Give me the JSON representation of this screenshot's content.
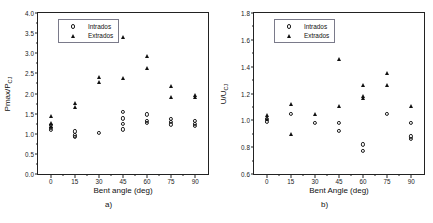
{
  "figure": {
    "panels": [
      {
        "id": "a",
        "caption": "a)",
        "legend": [
          {
            "label": "Intrados",
            "marker": "open-circle"
          },
          {
            "label": "Extrados",
            "marker": "filled-triangle"
          }
        ]
      },
      {
        "id": "b",
        "caption": "b)",
        "legend": [
          {
            "label": "Intrados",
            "marker": "open-circle"
          },
          {
            "label": "Extrados",
            "marker": "filled-triangle"
          }
        ]
      }
    ]
  },
  "chart_data": [
    {
      "type": "scatter",
      "panel": "a",
      "title": "",
      "xlabel": "Bent angle (deg)",
      "ylabel": "Pmax/PCJ",
      "ylabel_main": "Pmax/P",
      "ylabel_sub": "CJ",
      "xlim": [
        -8,
        98
      ],
      "ylim": [
        0.0,
        4.0
      ],
      "xticks": [
        0,
        15,
        30,
        45,
        60,
        75,
        90
      ],
      "xticklabels": [
        "0",
        "15",
        "30",
        "45",
        "60",
        "75",
        "90"
      ],
      "yticks": [
        0.0,
        0.5,
        1.0,
        1.5,
        2.0,
        2.5,
        3.0,
        3.5,
        4.0
      ],
      "yticklabels": [
        "0.0",
        "0.5",
        "1.0",
        "1.5",
        "2.0",
        "2.5",
        "3.0",
        "3.5",
        "4.0"
      ],
      "grid": false,
      "legend_position": "top-left",
      "series": [
        {
          "name": "Intrados",
          "marker": "open-circle",
          "points": [
            {
              "x": 0,
              "y": 1.22
            },
            {
              "x": 0,
              "y": 1.15
            },
            {
              "x": 0,
              "y": 1.09
            },
            {
              "x": 15,
              "y": 1.06
            },
            {
              "x": 15,
              "y": 0.96
            },
            {
              "x": 15,
              "y": 0.92
            },
            {
              "x": 30,
              "y": 1.02
            },
            {
              "x": 45,
              "y": 1.55
            },
            {
              "x": 45,
              "y": 1.38
            },
            {
              "x": 45,
              "y": 1.24
            },
            {
              "x": 45,
              "y": 1.11
            },
            {
              "x": 60,
              "y": 1.48
            },
            {
              "x": 60,
              "y": 1.32
            },
            {
              "x": 60,
              "y": 1.27
            },
            {
              "x": 75,
              "y": 1.37
            },
            {
              "x": 75,
              "y": 1.3
            },
            {
              "x": 75,
              "y": 1.23
            },
            {
              "x": 90,
              "y": 1.31
            },
            {
              "x": 90,
              "y": 1.24
            },
            {
              "x": 90,
              "y": 1.19
            }
          ]
        },
        {
          "name": "Extrados",
          "marker": "filled-triangle",
          "points": [
            {
              "x": 0,
              "y": 1.45
            },
            {
              "x": 0,
              "y": 1.26
            },
            {
              "x": 0,
              "y": 1.19
            },
            {
              "x": 15,
              "y": 1.76
            },
            {
              "x": 15,
              "y": 1.67
            },
            {
              "x": 30,
              "y": 2.4
            },
            {
              "x": 30,
              "y": 2.28
            },
            {
              "x": 45,
              "y": 3.41
            },
            {
              "x": 45,
              "y": 2.38
            },
            {
              "x": 60,
              "y": 2.93
            },
            {
              "x": 60,
              "y": 2.63
            },
            {
              "x": 75,
              "y": 2.19
            },
            {
              "x": 75,
              "y": 1.92
            },
            {
              "x": 90,
              "y": 1.96
            },
            {
              "x": 90,
              "y": 1.92
            }
          ]
        }
      ]
    },
    {
      "type": "scatter",
      "panel": "b",
      "title": "",
      "xlabel": "Bent Angle (deg)",
      "ylabel": "U/UCJ",
      "ylabel_main": "U/U",
      "ylabel_sub": "CJ",
      "xlim": [
        -8,
        98
      ],
      "ylim": [
        0.6,
        1.8
      ],
      "xticks": [
        0,
        15,
        30,
        45,
        60,
        75,
        90
      ],
      "xticklabels": [
        "0",
        "15",
        "30",
        "45",
        "60",
        "75",
        "90"
      ],
      "yticks": [
        0.6,
        0.8,
        1.0,
        1.2,
        1.4,
        1.6,
        1.8
      ],
      "yticklabels": [
        "0.6",
        "0.8",
        "1.0",
        "1.2",
        "1.4",
        "1.6",
        "1.8"
      ],
      "grid": false,
      "legend_position": "top-left",
      "series": [
        {
          "name": "Intrados",
          "marker": "open-circle",
          "points": [
            {
              "x": 0,
              "y": 1.01
            },
            {
              "x": 0,
              "y": 0.99
            },
            {
              "x": 15,
              "y": 1.05
            },
            {
              "x": 30,
              "y": 0.98
            },
            {
              "x": 45,
              "y": 0.98
            },
            {
              "x": 45,
              "y": 0.92
            },
            {
              "x": 60,
              "y": 0.82
            },
            {
              "x": 60,
              "y": 0.77
            },
            {
              "x": 75,
              "y": 1.05
            },
            {
              "x": 90,
              "y": 0.98
            },
            {
              "x": 90,
              "y": 0.88
            },
            {
              "x": 90,
              "y": 0.86
            }
          ]
        },
        {
          "name": "Extrados",
          "marker": "filled-triangle",
          "points": [
            {
              "x": 0,
              "y": 1.04
            },
            {
              "x": 0,
              "y": 1.01
            },
            {
              "x": 15,
              "y": 1.12
            },
            {
              "x": 15,
              "y": 0.9
            },
            {
              "x": 30,
              "y": 1.05
            },
            {
              "x": 45,
              "y": 1.46
            },
            {
              "x": 45,
              "y": 1.11
            },
            {
              "x": 60,
              "y": 1.26
            },
            {
              "x": 60,
              "y": 1.18
            },
            {
              "x": 60,
              "y": 1.17
            },
            {
              "x": 75,
              "y": 1.35
            },
            {
              "x": 75,
              "y": 1.26
            },
            {
              "x": 90,
              "y": 1.11
            }
          ]
        }
      ]
    }
  ]
}
